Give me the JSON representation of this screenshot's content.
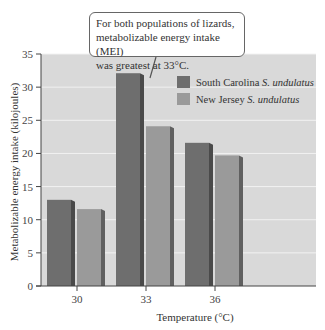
{
  "chart_data": {
    "type": "bar",
    "title": "",
    "xlabel": "Temperature (°C)",
    "ylabel": "Metabolizable energy intake (kilojoules)",
    "categories": [
      "30",
      "33",
      "36"
    ],
    "series": [
      {
        "name": "South Carolina",
        "name_italic": "S. undulatus",
        "color": "#6e6e6e",
        "side": "#4a4a4a",
        "values": [
          13.0,
          32.1,
          21.6
        ]
      },
      {
        "name": "New Jersey",
        "name_italic": "S. undulatus",
        "color": "#9a9a9a",
        "side": "#606060",
        "values": [
          11.6,
          24.1,
          19.7
        ]
      }
    ],
    "ylim": [
      0,
      35
    ],
    "yticks": [
      0,
      5,
      10,
      15,
      20,
      25,
      30,
      35
    ],
    "grid": true,
    "legend_position": "upper right inside",
    "annotation": "For both populations of lizards, metabolizable energy intake (MEI) was greatest at 33°C.",
    "plot_background": "#d9d9d9"
  },
  "callout": {
    "lines": [
      "For both populations of lizards,",
      "metabolizable energy intake (MEI)",
      "was greatest at 33°C."
    ]
  },
  "legend": {
    "items": [
      {
        "label": "South Carolina",
        "italic": "S. undulatus"
      },
      {
        "label": "New Jersey",
        "italic": "S. undulatus"
      }
    ]
  },
  "axes": {
    "x_title": "Temperature (°C)",
    "y_title": "Metabolizable energy intake (kilojoules)"
  }
}
